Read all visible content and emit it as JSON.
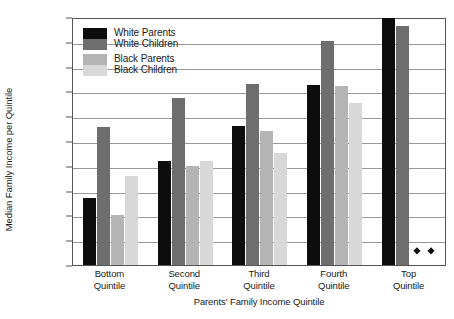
{
  "chart_data": {
    "type": "bar",
    "title": "",
    "xlabel": "Parents' Family Income Quintile",
    "ylabel": "Median Family Income per Quintile",
    "categories": [
      "Bottom Quintile",
      "Second Quintile",
      "Third Quintile",
      "Fourth Quintile",
      "Top Quintile"
    ],
    "category_lines": [
      [
        "Bottom",
        "Quintile"
      ],
      [
        "Second",
        "Quintile"
      ],
      [
        "Third",
        "Quintile"
      ],
      [
        "Fourth",
        "Quintile"
      ],
      [
        "Top",
        "Quintile"
      ]
    ],
    "series": [
      {
        "name": "White Parents",
        "key": "wp",
        "color": "#0d0d0d",
        "values": [
          27000,
          42000,
          56000,
          72500,
          99500
        ]
      },
      {
        "name": "White Children",
        "key": "wc",
        "color": "#6e6e6e",
        "values": [
          55500,
          67500,
          73000,
          90500,
          96500
        ]
      },
      {
        "name": "Black Parents",
        "key": "bp",
        "color": "#b4b4b4",
        "values": [
          20000,
          40000,
          54000,
          72000,
          null
        ]
      },
      {
        "name": "Black Children",
        "key": "bc",
        "color": "#d8d8d8",
        "values": [
          36000,
          42000,
          45000,
          65500,
          null
        ]
      }
    ],
    "suppressed_markers": {
      "category": "Top Quintile",
      "series": [
        "Black Parents",
        "Black Children"
      ],
      "marker": "diamond",
      "count": 2
    },
    "ylim": [
      0,
      100000
    ],
    "ytick_values": [
      0,
      10000,
      20000,
      30000,
      40000,
      50000,
      60000,
      70000,
      80000,
      90000,
      100000
    ],
    "ytick_labels": [
      "$0",
      "$10,000",
      "$20,000",
      "$30,000",
      "$40,000",
      "$50,000",
      "$60,000",
      "$70,000",
      "$80,000",
      "$90,000",
      "$100,000"
    ],
    "grid": true,
    "legend_position": "top-left"
  },
  "legend": {
    "entries": [
      {
        "label": "White Parents",
        "swatch": "sw-wp"
      },
      {
        "label": "White Children",
        "swatch": "sw-wc"
      },
      {
        "label": "Black Parents",
        "swatch": "sw-bp"
      },
      {
        "label": "Black Children",
        "swatch": "sw-bc"
      }
    ]
  }
}
